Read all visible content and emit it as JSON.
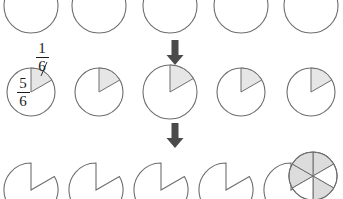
{
  "diagram": {
    "background_color": "#ffffff",
    "stroke_color": "#6e6e6e",
    "shade_color": "#e6e6e6",
    "arrow_color": "#4a4a4a",
    "text_color": "#1b1b1b"
  },
  "labels": {
    "one_sixth": {
      "numerator": "1",
      "denominator": "6"
    },
    "five_sixths": {
      "numerator": "5",
      "denominator": "6"
    }
  },
  "rows": {
    "top": {
      "name": "empty-circles-row",
      "count": 5,
      "shaded_sixths": 0,
      "circles": [
        {
          "cx": 31,
          "cy": 6,
          "r": 27,
          "state": "empty"
        },
        {
          "cx": 99,
          "cy": 6,
          "r": 27,
          "state": "empty"
        },
        {
          "cx": 170,
          "cy": 6,
          "r": 27,
          "state": "empty"
        },
        {
          "cx": 241,
          "cy": 6,
          "r": 27,
          "state": "empty"
        },
        {
          "cx": 311,
          "cy": 6,
          "r": 27,
          "state": "empty"
        }
      ]
    },
    "middle": {
      "name": "one-sixth-shaded-row",
      "count": 5,
      "shaded_sixths": 1,
      "circles": [
        {
          "cx": 31,
          "cy": 92,
          "r": 24,
          "state": "one-sixth-shaded"
        },
        {
          "cx": 99,
          "cy": 92,
          "r": 24,
          "state": "one-sixth-shaded"
        },
        {
          "cx": 170,
          "cy": 92,
          "r": 27,
          "state": "one-sixth-shaded"
        },
        {
          "cx": 241,
          "cy": 92,
          "r": 24,
          "state": "one-sixth-shaded"
        },
        {
          "cx": 311,
          "cy": 92,
          "r": 24,
          "state": "one-sixth-shaded"
        }
      ]
    },
    "bottom": {
      "name": "five-sixths-remaining-row",
      "count": 6,
      "removed_sixths": 1,
      "circles": [
        {
          "cx": 31,
          "cy": 190,
          "r": 27,
          "state": "one-sixth-removed"
        },
        {
          "cx": 96,
          "cy": 190,
          "r": 27,
          "state": "one-sixth-removed"
        },
        {
          "cx": 161,
          "cy": 190,
          "r": 27,
          "state": "one-sixth-removed"
        },
        {
          "cx": 226,
          "cy": 190,
          "r": 27,
          "state": "one-sixth-removed"
        },
        {
          "cx": 291,
          "cy": 190,
          "r": 27,
          "state": "one-sixth-removed"
        },
        {
          "cx": 313,
          "cy": 176,
          "r": 24,
          "state": "six-sectors-alternating"
        }
      ]
    }
  },
  "arrows": [
    {
      "name": "arrow-top-to-middle",
      "x": 175,
      "y_top": 40,
      "y_bottom": 64
    },
    {
      "name": "arrow-middle-to-bottom",
      "x": 175,
      "y_top": 123,
      "y_bottom": 148
    }
  ]
}
